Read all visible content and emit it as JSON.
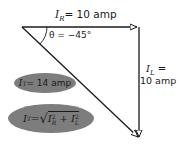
{
  "diagram": {
    "type": "phasor-triangle",
    "stroke_color": "#1a1a1a",
    "ellipse_color": "#7d7d7d",
    "labels": {
      "ir_var": "I",
      "ir_sub": "R",
      "ir_value": "= 10 amp",
      "theta": "θ = −45°",
      "il_var": "I",
      "il_sub": "L",
      "il_eq": " =",
      "il_value": "10 amp",
      "it_var": "I",
      "it_sub": "T",
      "it_value": "= 14 amp",
      "formula_lhs": "I",
      "formula_lhs_sub": "T",
      "formula_eq": " = ",
      "formula_rad": "√",
      "formula_t1": "I",
      "formula_t1_sup": "2",
      "formula_t1_sub": "R",
      "formula_plus": " + ",
      "formula_t2": "I",
      "formula_t2_sup": "2",
      "formula_t2_sub": "L"
    },
    "vectors": [
      {
        "name": "I_R",
        "from": [
          22,
          27
        ],
        "to": [
          138,
          27
        ]
      },
      {
        "name": "I_L",
        "from": [
          139,
          27
        ],
        "to": [
          139,
          138
        ]
      },
      {
        "name": "I_T",
        "from": [
          22,
          27
        ],
        "to": [
          139,
          138
        ]
      }
    ]
  }
}
